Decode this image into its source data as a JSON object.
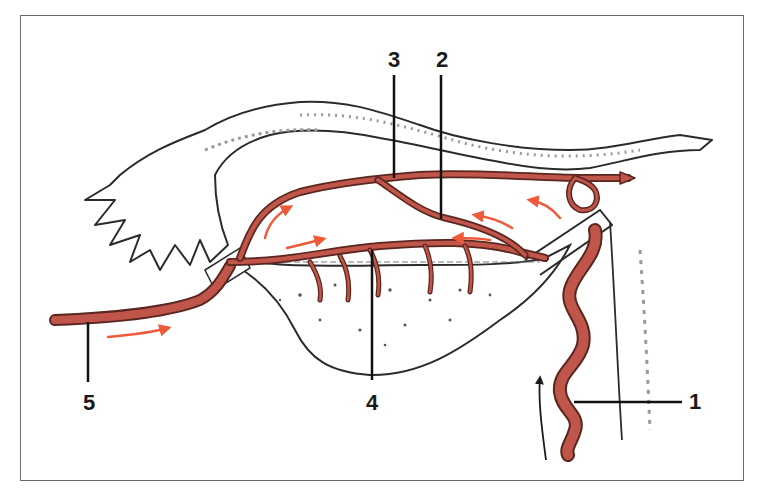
{
  "diagram": {
    "type": "anatomical-illustration",
    "colors": {
      "vessel": "#c0554a",
      "vessel_outline": "#5a2620",
      "flow_arrow": "#ef5a3a",
      "tissue_outline": "#2b2b2b",
      "tissue_shade": "#9a9a9a",
      "frame": "#6a6a6a",
      "leader": "#111111"
    },
    "labels": [
      {
        "id": "1",
        "text": "1",
        "target": "tortuous ascending artery (right, lower)"
      },
      {
        "id": "2",
        "text": "2",
        "target": "lower arcade branch"
      },
      {
        "id": "3",
        "text": "3",
        "target": "upper tubal branch"
      },
      {
        "id": "4",
        "text": "4",
        "target": "ovarian branch with small rami"
      },
      {
        "id": "5",
        "text": "5",
        "target": "artery entering from left"
      }
    ],
    "flow_arrows": {
      "count_orange": 7,
      "count_black": 1
    }
  }
}
